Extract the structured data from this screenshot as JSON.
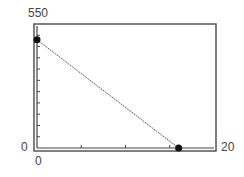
{
  "chart_data": {
    "type": "line",
    "title": "",
    "xlabel": "",
    "ylabel": "",
    "xlim": [
      0,
      20
    ],
    "ylim": [
      0,
      550
    ],
    "grid": false,
    "legend": null,
    "x_tick_labels": [
      "0",
      "20"
    ],
    "y_tick_labels": [
      "0",
      "550"
    ],
    "x_minor_ticks": [
      5,
      10,
      15
    ],
    "y_minor_ticks": [
      50,
      100,
      150,
      200,
      250,
      300,
      350,
      400,
      450,
      500
    ],
    "series": [
      {
        "name": "line",
        "x": [
          0,
          16
        ],
        "y": [
          480,
          0
        ],
        "marker_points": [
          [
            0,
            480
          ],
          [
            16,
            0
          ]
        ]
      }
    ]
  },
  "labels": {
    "y_max": "550",
    "y_min": "0",
    "x_min": "0",
    "x_max": "20"
  }
}
